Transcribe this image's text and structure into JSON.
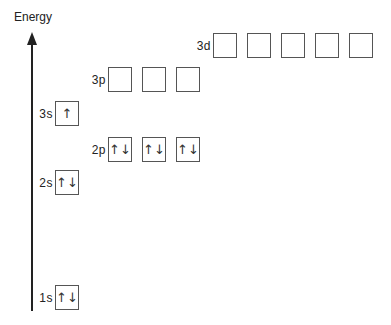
{
  "axis": {
    "title": "Energy",
    "direction": "up"
  },
  "orbitals": {
    "o3d": {
      "label": "3d",
      "boxes": [
        "",
        "",
        "",
        "",
        ""
      ]
    },
    "o3p": {
      "label": "3p",
      "boxes": [
        "",
        "",
        ""
      ]
    },
    "o3s": {
      "label": "3s",
      "boxes": [
        "↑"
      ]
    },
    "o2p": {
      "label": "2p",
      "boxes": [
        "↑↓",
        "↑↓",
        "↑↓"
      ]
    },
    "o2s": {
      "label": "2s",
      "boxes": [
        "↑↓"
      ]
    },
    "o1s": {
      "label": "1s",
      "boxes": [
        "↑↓"
      ]
    }
  },
  "colors": {
    "line": "#222222",
    "box_border": "#555555",
    "background": "#ffffff"
  }
}
